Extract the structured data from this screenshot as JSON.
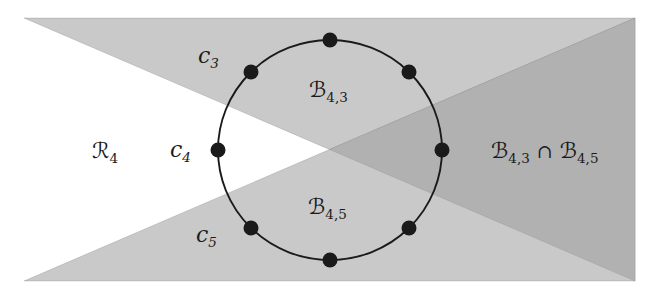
{
  "colors": {
    "background": "#ffffff",
    "shade_single": "#c9c9c9",
    "shade_overlap": "#b1b1b1",
    "ink": "#1a1a1a"
  },
  "labels": {
    "r4": {
      "main": "ℛ",
      "sub": "4"
    },
    "c3": {
      "main": "c",
      "sub": "3"
    },
    "c4": {
      "main": "c",
      "sub": "4"
    },
    "c5": {
      "main": "c",
      "sub": "5"
    },
    "b43": {
      "main": "ℬ",
      "sub": "4,3"
    },
    "b45": {
      "main": "ℬ",
      "sub": "4,5"
    },
    "intersection": {
      "main1": "ℬ",
      "sub1": "4,3",
      "op": "∩",
      "main2": "ℬ",
      "sub2": "4,5"
    }
  }
}
